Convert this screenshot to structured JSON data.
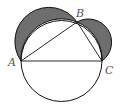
{
  "diagram": {
    "type": "geometry",
    "points": {
      "A": {
        "label": "A",
        "x": 21,
        "y": 61
      },
      "B": {
        "label": "B",
        "x": 77,
        "y": 22
      },
      "C": {
        "label": "C",
        "x": 102,
        "y": 61
      }
    },
    "shaded_regions": [
      "lune-AB",
      "lune-BC"
    ],
    "colors": {
      "stroke": "#111111",
      "shade": "#6e6e6e",
      "label": "#555555",
      "background": "#ffffff"
    }
  }
}
